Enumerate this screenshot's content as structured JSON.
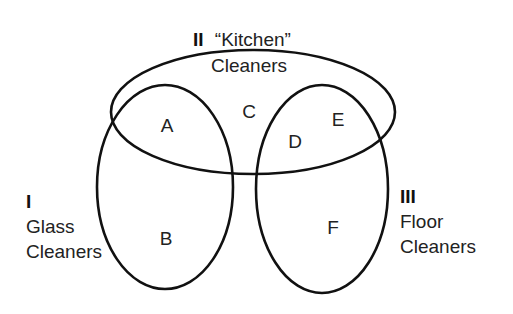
{
  "diagram": {
    "type": "venn",
    "sets": [
      {
        "id": "I",
        "numeral": "I",
        "name_line1": "Glass",
        "name_line2": "Cleaners"
      },
      {
        "id": "II",
        "numeral": "II",
        "name_line1": "“Kitchen”",
        "name_line2": "Cleaners"
      },
      {
        "id": "III",
        "numeral": "III",
        "name_line1": "Floor",
        "name_line2": "Cleaners"
      }
    ],
    "regions": {
      "A": "A",
      "B": "B",
      "C": "C",
      "D": "D",
      "E": "E",
      "F": "F"
    },
    "colors": {
      "stroke": "#111111",
      "text": "#222222",
      "background": "#ffffff"
    }
  }
}
